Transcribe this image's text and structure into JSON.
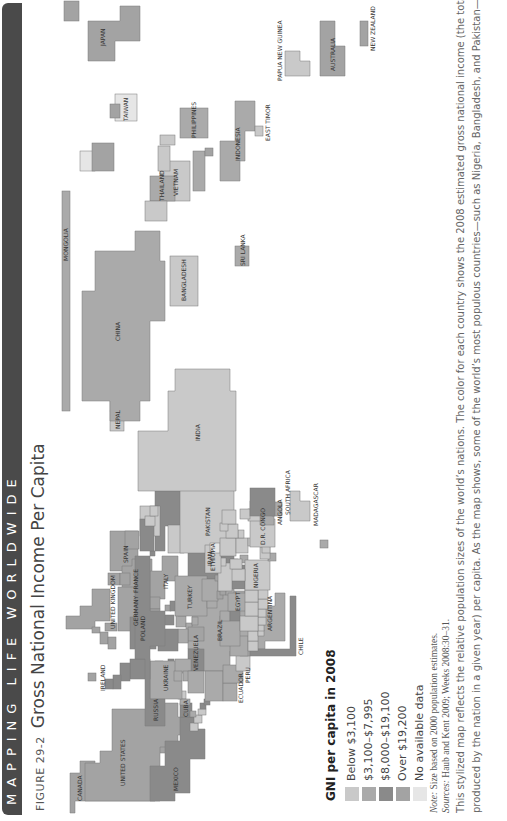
{
  "banner": {
    "text": "MAPPING LIFE WORLDWIDE"
  },
  "figure": {
    "number": "FIGURE 29-2",
    "title": "Gross National Income Per Capita"
  },
  "legend": {
    "title": "GNI per capita in 2008",
    "items": [
      {
        "label": "Below $3,100",
        "color": "#c9c9c9"
      },
      {
        "label": "$3,100–$7,995",
        "color": "#aaaaaa"
      },
      {
        "label": "$8,000–$19,100",
        "color": "#8a8a8a"
      },
      {
        "label": "Over $19,200",
        "color": "#a3a3a3"
      },
      {
        "label": "No available data",
        "color": "#e6e6e6"
      }
    ]
  },
  "notes": {
    "note_label": "Note:",
    "note_text": " Size based on 2000 population estimates.",
    "sources_label": "Sources:",
    "sources_text": " Haub and Kent 2009; Weeks 2008:30–31.",
    "body_line1": "This stylized map reflects the relative population sizes of the world’s nations. The color for each country shows the 2008 estimated gross national income (the total value of goods and services",
    "body_line2": "produced by the nation in a given year) per capita. As the map shows, some of the world’s most populous countries—such as Nigeria, Bangladesh, and Pakistan—are among the nations with"
  },
  "map": {
    "labels": {
      "canada": "CANADA",
      "united_states": "UNITED STATES",
      "mexico": "MEXICO",
      "cuba": "CUBA",
      "guatemala": "GUATEMALA",
      "honduras": "HONDURAS",
      "el_salvador": "EL SALVADOR",
      "nicaragua": "NICARAGUA",
      "costa_rica": "COSTA RICA",
      "panama": "PANAMA",
      "haiti": "HAITI",
      "dominican_republic": "DOMINICAN REPUBLIC",
      "puerto_rico": "PUERTO RICO",
      "jamaica": "JAMAICA",
      "trinidad": "TRINIDAD AND TOBAGO",
      "venezuela": "VENEZUELA",
      "colombia": "COLOMBIA",
      "ecuador": "ECUADOR",
      "peru": "PERU",
      "bolivia": "BOLIVIA",
      "brazil": "BRAZIL",
      "paraguay": "PARAGUAY",
      "uruguay": "URUGUAY",
      "argentina": "ARGENTINA",
      "chile": "CHILE",
      "ireland": "IRELAND",
      "united_kingdom": "UNITED KINGDOM",
      "spain": "SPAIN",
      "portugal": "PORTUGAL",
      "france": "FRANCE",
      "netherlands": "NETHERLANDS",
      "belgium": "BELGIUM",
      "germany": "GERMANY",
      "denmark": "DENMARK",
      "norway": "NORWAY",
      "sweden": "SWEDEN",
      "finland": "FINLAND",
      "switz": "SWITZ.",
      "italy": "ITALY",
      "austria": "AUSTRIA",
      "poland": "POLAND",
      "czech": "CZECH",
      "slovakia": "SLOVAK.",
      "hungary": "HUNGARY",
      "slovenia": "SLOVENIA",
      "croatia": "CROATIA",
      "bosnia": "B.-H.",
      "serbia": "SERBIA",
      "macedonia": "MACEDONIA",
      "albania": "ALBANIA",
      "greece": "GREECE",
      "bulgaria": "BULGARIA",
      "romania": "ROMANIA",
      "moldova": "MOL.",
      "ukraine": "UKRAINE",
      "belarus": "BELARUS",
      "lithuania": "LITHUANIA",
      "latvia": "LATVIA",
      "estonia": "ESTONIA",
      "russia": "RUSSIA",
      "georgia": "GEORGIA",
      "armenia": "ARMENIA",
      "azerbaijan": "AZER.",
      "turkey": "TURKEY",
      "syria": "SYRIA",
      "lebanon": "LEBANON",
      "israel": "ISRAEL",
      "jordan": "JORDAN",
      "west_bank": "WEST BANK",
      "gaza": "GAZA STRIP",
      "iraq": "IRAQ",
      "kuwait": "KUWAIT",
      "saudi_arabia": "SAUDI ARABIA",
      "uae": "UAE",
      "oman": "OMAN",
      "yemen": "YEMEN",
      "iran": "IRAN",
      "turkmenistan": "TURKMENISTAN",
      "uzbekistan": "UZBEKISTAN",
      "kazakhstan": "KAZAKHSTAN",
      "kyrgyzstan": "KYRGYZSTAN",
      "tajikistan": "TAJIKISTAN",
      "afghanistan": "AFGHANISTAN",
      "pakistan": "PAKISTAN",
      "india": "INDIA",
      "nepal": "NEPAL",
      "bhutan": "BHUTAN",
      "bangladesh": "BANGLADESH",
      "sri_lanka": "SRI LANKA",
      "china": "CHINA",
      "mongolia": "MONGOLIA",
      "north_korea": "NORTH KOREA",
      "south_korea": "SOUTH KOREA",
      "japan": "JAPAN",
      "taiwan": "TAIWAN",
      "hong_kong": "HONG KONG",
      "philippines": "PHILIPPINES",
      "vietnam": "VIETNAM",
      "laos": "LAOS",
      "cambodia": "CAMBODIA",
      "thailand": "THAILAND",
      "myanmar": "MYANMAR",
      "malaysia": "MALAYSIA",
      "singapore": "SINGAPORE",
      "indonesia": "INDONESIA",
      "east_timor": "EAST TIMOR",
      "papua_new_guinea": "PAPUA NEW GUINEA",
      "australia": "AUSTRALIA",
      "new_zealand": "NEW ZEALAND",
      "morocco": "MOROCCO",
      "algeria": "ALGERIA",
      "tunisia": "TUNISIA",
      "libya": "LIBYA",
      "egypt": "EGYPT",
      "mauritania": "MAURITANIA",
      "senegal": "SENEGAL",
      "gambia": "GAMBIA",
      "guinea_bissau": "GUINEA-BISSAU",
      "sierra_leone": "SIERRA LEONE",
      "liberia": "LIBERIA",
      "cote_divoire": "COTE D'IVOIRE",
      "ghana": "GHANA",
      "togo": "TOGO",
      "benin": "BENIN",
      "mali": "MALI",
      "niger": "NIGER",
      "burkina": "BURKINA FASO",
      "nigeria": "NIGERIA",
      "chad": "CHAD",
      "sudan": "SUDAN",
      "eritrea": "ERITREA",
      "ethiopia": "ETHIOPIA",
      "somalia": "SOMALIA",
      "kenya": "KENYA",
      "uganda": "UGANDA",
      "rwanda": "RWANDA",
      "burundi": "BURUNDI",
      "tanzania": "TANZANIA",
      "malawi": "MALAWI",
      "mozambique": "MOZAMBIQUE",
      "gabon": "GABON",
      "cameroon": "CAMEROON",
      "congo": "CONGO",
      "dr_congo": "D.R. CONGO",
      "angola": "ANGOLA",
      "namibia": "NAMIBIA",
      "zambia": "ZAMBIA",
      "zimbabwe": "ZIMBABWE",
      "botswana": "BOTSWANA",
      "swaziland": "SWAZILAND",
      "lesotho": "LESOTHO",
      "south_africa": "SOUTH AFRICA",
      "madagascar": "MADAGASCAR",
      "mauritius": "MAURITIUS",
      "car": "CAR"
    }
  }
}
